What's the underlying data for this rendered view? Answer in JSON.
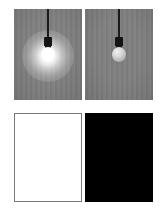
{
  "figure": {
    "layout": "2x2-grid",
    "background_color": "#ffffff",
    "panels": [
      {
        "id": "bulb-lit",
        "position": "top-left",
        "caption": "",
        "scene": "hanging light bulb, switched on, emitting bright glow",
        "background_color": "#808080",
        "bulb_state": "on",
        "glow_color": "#ffffff",
        "cord_color": "#1a1a1a",
        "socket_color": "#141414"
      },
      {
        "id": "bulb-unlit",
        "position": "top-right",
        "caption": "",
        "scene": "hanging light bulb, switched off, no glow",
        "background_color": "#808080",
        "bulb_state": "off",
        "glass_color": "#c8c8c8",
        "cord_color": "#1a1a1a",
        "socket_color": "#141414"
      },
      {
        "id": "swatch-white",
        "position": "bottom-left",
        "caption": "",
        "scene": "solid white panel with thin gray outline",
        "fill_color": "#ffffff",
        "border_color": "#76787a"
      },
      {
        "id": "swatch-black",
        "position": "bottom-right",
        "caption": "",
        "scene": "solid black panel",
        "fill_color": "#000000",
        "border_color": "#000000"
      }
    ]
  }
}
